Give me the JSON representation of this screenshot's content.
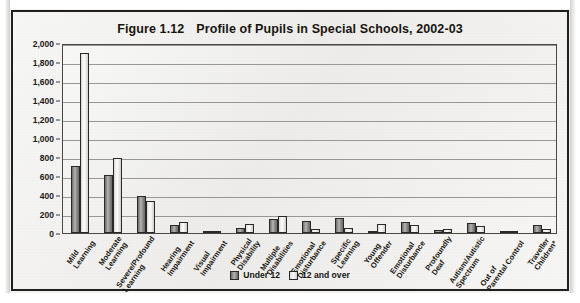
{
  "figure": {
    "number": "Figure 1.12",
    "title": "Profile of Pupils in Special Schools, 2002-03"
  },
  "legend": {
    "items": [
      {
        "label": "Under 12",
        "color": "#8b8985"
      },
      {
        "label": "12 and over",
        "color": "#f2f1ef"
      }
    ]
  },
  "chart_data": {
    "type": "bar",
    "xlabel": "",
    "ylabel": "",
    "ylim": [
      0,
      2000
    ],
    "ytick_step": 200,
    "grid": true,
    "legend_position": "bottom-center",
    "ytick_labels": [
      "0",
      "200",
      "400",
      "600",
      "800",
      "1,000",
      "1,200",
      "1,400",
      "1,600",
      "1,800",
      "2,000"
    ],
    "categories": [
      "Mild Learning",
      "Moderate Learning",
      "Severe/Profound Learning",
      "Hearing Impairment",
      "Visual Impairment",
      "Physical Disability",
      "Multiple Disabilities",
      "Emotional Disturbance",
      "Specific Learning",
      "Young Offender",
      "Emotional Disturbance",
      "Profoundly Deaf",
      "Autism/Autistic Spectrum",
      "Out of Parental Control",
      "Traveller Children*"
    ],
    "category_lines": [
      [
        "Mild",
        "Learning"
      ],
      [
        "Moderate",
        "Learning"
      ],
      [
        "Severe/Profound",
        "Learning"
      ],
      [
        "Hearing",
        "Impairment"
      ],
      [
        "Visual",
        "Impairment"
      ],
      [
        "Physical",
        "Disability"
      ],
      [
        "Multiple",
        "Disabilities"
      ],
      [
        "Emotional",
        "Disturbance"
      ],
      [
        "Specific",
        "Learning"
      ],
      [
        "Young",
        "Offender"
      ],
      [
        "Emotional",
        "Disturbance"
      ],
      [
        "Profoundly",
        "Deaf"
      ],
      [
        "Autism/Autistic",
        "Spectrum"
      ],
      [
        "Out of",
        "Parental Control"
      ],
      [
        "Traveller",
        "Children*"
      ]
    ],
    "series": [
      {
        "name": "Under 12",
        "values": [
          710,
          610,
          390,
          80,
          20,
          55,
          150,
          130,
          160,
          0,
          120,
          30,
          110,
          10,
          85
        ]
      },
      {
        "name": "12 and over",
        "values": [
          1890,
          790,
          335,
          115,
          25,
          90,
          175,
          45,
          55,
          100,
          80,
          45,
          75,
          5,
          40
        ]
      }
    ]
  }
}
